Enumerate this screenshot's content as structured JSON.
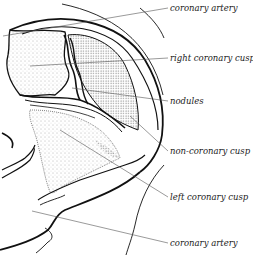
{
  "figure": {
    "labels": [
      {
        "id": "coronary-artery-top",
        "text": "coronary artery",
        "x": 170,
        "y": 4
      },
      {
        "id": "right-coronary-cusp",
        "text": "right coronary cusp",
        "x": 170,
        "y": 54
      },
      {
        "id": "nodules",
        "text": "nodules",
        "x": 170,
        "y": 97
      },
      {
        "id": "non-coronary-cusp",
        "text": "non-coronary cusp",
        "x": 170,
        "y": 147
      },
      {
        "id": "left-coronary-cusp",
        "text": "left coronary cusp",
        "x": 170,
        "y": 193
      },
      {
        "id": "coronary-artery-bottom",
        "text": "coronary artery",
        "x": 170,
        "y": 239
      }
    ],
    "colors": {
      "ink": "#111111",
      "leader": "#555555",
      "stipple": "#666666"
    }
  }
}
